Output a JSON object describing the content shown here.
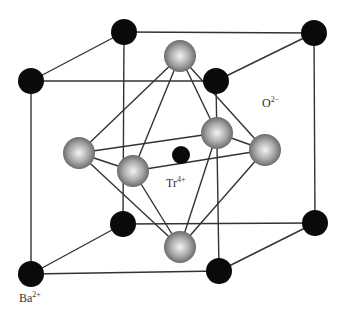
{
  "colors": {
    "background": "#ffffff",
    "bond_line": "#333333",
    "ba_atom": "#0a0a0a",
    "ti_atom": "#0a0a0a",
    "o_atom_light": "#f2f2f2",
    "o_atom_mid": "#a8a8a8",
    "o_atom_dark": "#5a5a5a"
  },
  "labels": {
    "oxygen": {
      "base": "O",
      "charge": "2−",
      "x": 262,
      "y": 96
    },
    "titanium": {
      "base": "Tr",
      "charge": "4+",
      "x": 166,
      "y": 176
    },
    "barium": {
      "base": "Ba",
      "charge": "2+",
      "x": 19,
      "y": 291
    }
  },
  "atoms": {
    "barium": [
      {
        "id": "ba-back-top-left",
        "x": 124,
        "y": 32,
        "r": 13
      },
      {
        "id": "ba-back-top-right",
        "x": 314,
        "y": 33,
        "r": 13
      },
      {
        "id": "ba-front-top-left",
        "x": 31,
        "y": 81,
        "r": 13
      },
      {
        "id": "ba-front-top-right",
        "x": 216,
        "y": 81,
        "r": 13
      },
      {
        "id": "ba-back-bottom-left",
        "x": 123,
        "y": 224,
        "r": 13
      },
      {
        "id": "ba-back-bottom-right",
        "x": 315,
        "y": 223,
        "r": 13
      },
      {
        "id": "ba-front-bottom-left",
        "x": 31,
        "y": 274,
        "r": 13
      },
      {
        "id": "ba-front-bottom-right",
        "x": 219,
        "y": 271,
        "r": 13
      }
    ],
    "oxygen": [
      {
        "id": "o-top",
        "x": 180,
        "y": 56,
        "r": 16
      },
      {
        "id": "o-left",
        "x": 79,
        "y": 153,
        "r": 16
      },
      {
        "id": "o-front",
        "x": 133,
        "y": 171,
        "r": 16
      },
      {
        "id": "o-back",
        "x": 217,
        "y": 133,
        "r": 16
      },
      {
        "id": "o-right",
        "x": 265,
        "y": 150,
        "r": 16
      },
      {
        "id": "o-bottom",
        "x": 180,
        "y": 247,
        "r": 16
      }
    ],
    "titanium": [
      {
        "id": "ti-center",
        "x": 181,
        "y": 155,
        "r": 9
      }
    ]
  },
  "cube_edges": [
    [
      "ba-back-top-left",
      "ba-back-top-right"
    ],
    [
      "ba-front-top-left",
      "ba-front-top-right"
    ],
    [
      "ba-back-top-left",
      "ba-front-top-left"
    ],
    [
      "ba-back-top-right",
      "ba-front-top-right"
    ],
    [
      "ba-back-bottom-left",
      "ba-back-bottom-right"
    ],
    [
      "ba-front-bottom-left",
      "ba-front-bottom-right"
    ],
    [
      "ba-back-bottom-left",
      "ba-front-bottom-left"
    ],
    [
      "ba-back-bottom-right",
      "ba-front-bottom-right"
    ],
    [
      "ba-back-top-left",
      "ba-back-bottom-left"
    ],
    [
      "ba-back-top-right",
      "ba-back-bottom-right"
    ],
    [
      "ba-front-top-left",
      "ba-front-bottom-left"
    ],
    [
      "ba-front-top-right",
      "ba-front-bottom-right"
    ]
  ],
  "octahedron_edges": [
    [
      "o-top",
      "o-left"
    ],
    [
      "o-top",
      "o-front"
    ],
    [
      "o-top",
      "o-back"
    ],
    [
      "o-top",
      "o-right"
    ],
    [
      "o-bottom",
      "o-left"
    ],
    [
      "o-bottom",
      "o-front"
    ],
    [
      "o-bottom",
      "o-back"
    ],
    [
      "o-bottom",
      "o-right"
    ],
    [
      "o-left",
      "o-front"
    ],
    [
      "o-front",
      "o-right"
    ],
    [
      "o-right",
      "o-back"
    ],
    [
      "o-back",
      "o-left"
    ]
  ]
}
